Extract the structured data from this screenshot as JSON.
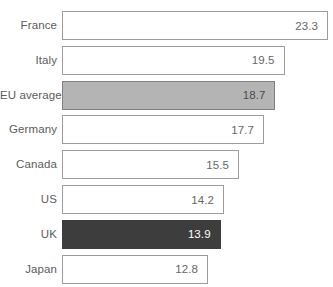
{
  "chart_data": {
    "type": "bar",
    "title": "",
    "subtitle": "",
    "xlabel": "",
    "ylabel": "",
    "orientation": "horizontal",
    "grid": false,
    "legend": null,
    "xlim": [
      0,
      23.3
    ],
    "categories": [
      "France",
      "Italy",
      "EU average",
      "Germany",
      "Canada",
      "US",
      "UK",
      "Japan"
    ],
    "values": [
      23.3,
      19.5,
      18.7,
      17.7,
      15.5,
      14.2,
      13.9,
      12.8
    ],
    "value_labels": [
      "23.3",
      "19.5",
      "18.7",
      "17.7",
      "15.5",
      "14.2",
      "13.9",
      "12.8"
    ],
    "bars": [
      {
        "label": "France",
        "value": 23.3,
        "value_label": "23.3",
        "style": "plain"
      },
      {
        "label": "Italy",
        "value": 19.5,
        "value_label": "19.5",
        "style": "plain"
      },
      {
        "label": "EU average",
        "value": 18.7,
        "value_label": "18.7",
        "style": "highlight-light"
      },
      {
        "label": "Germany",
        "value": 17.7,
        "value_label": "17.7",
        "style": "plain"
      },
      {
        "label": "Canada",
        "value": 15.5,
        "value_label": "15.5",
        "style": "plain"
      },
      {
        "label": "US",
        "value": 14.2,
        "value_label": "14.2",
        "style": "plain"
      },
      {
        "label": "UK",
        "value": 13.9,
        "value_label": "13.9",
        "style": "highlight-dark"
      },
      {
        "label": "Japan",
        "value": 12.8,
        "value_label": "12.8",
        "style": "plain"
      }
    ],
    "colors": {
      "bar_fill_default": "#ffffff",
      "bar_border_default": "#9c9c9c",
      "bar_fill_highlight_light": "#b4b4b4",
      "bar_fill_highlight_dark": "#3d3d3d",
      "label_text": "#5b5b5b",
      "value_text": "#666666",
      "value_text_on_dark": "#ffffff",
      "background": "#ffffff"
    }
  }
}
